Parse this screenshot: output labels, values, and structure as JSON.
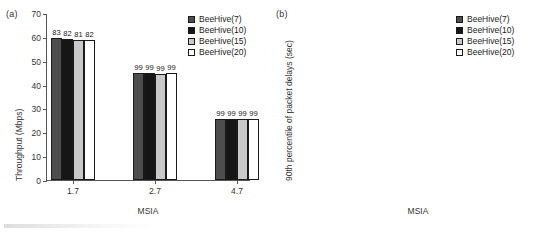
{
  "figure": {
    "width": 540,
    "height": 235,
    "background": "#ffffff"
  },
  "series_styles": [
    {
      "name": "BeeHive(7)",
      "color": "#4d4d4d"
    },
    {
      "name": "BeeHive(10)",
      "color": "#161616"
    },
    {
      "name": "BeeHive(15)",
      "color": "#c9c9c9"
    },
    {
      "name": "BeeHive(20)",
      "color": "#ffffff"
    }
  ],
  "panels": {
    "a": {
      "tag": "(a)",
      "legend": {
        "position": "top-right",
        "entries": [
          "BeeHive(7)",
          "BeeHive(10)",
          "BeeHive(15)",
          "BeeHive(20)"
        ]
      },
      "y_ticks": [
        "0",
        "10",
        "20",
        "30",
        "40",
        "50",
        "60",
        "70"
      ],
      "x_ticks": [
        "1.7",
        "2.7",
        "4.7"
      ],
      "xlabel": "MSIA",
      "ylabel": "Throughput (Mbps)"
    },
    "b": {
      "tag": "(b)",
      "legend": {
        "position": "top-right",
        "entries": [
          "BeeHive(7)",
          "BeeHive(10)",
          "BeeHive(15)",
          "BeeHive(20)"
        ]
      },
      "y_ticks": [
        "0",
        "1",
        "2",
        "3",
        "4",
        "5",
        "6",
        "7",
        "8"
      ],
      "x_ticks": [
        "1.7",
        "2.7",
        "4.7"
      ],
      "xlabel": "MSIA",
      "ylabel": "90th percentile of packet delays (sec)"
    }
  },
  "chart_data": [
    {
      "type": "bar",
      "panel": "(a)",
      "title": "",
      "xlabel": "MSIA",
      "ylabel": "Throughput (Mbps)",
      "categories": [
        "1.7",
        "2.7",
        "4.7"
      ],
      "ylim": [
        0,
        70
      ],
      "ytick_step": 10,
      "grid": false,
      "legend_position": "top-right",
      "series": [
        {
          "name": "BeeHive(7)",
          "color": "#4d4d4d",
          "values": [
            59.5,
            44.9,
            25.7
          ],
          "bar_labels": [
            "83",
            "99",
            "99"
          ]
        },
        {
          "name": "BeeHive(10)",
          "color": "#161616",
          "values": [
            59.3,
            44.9,
            25.6
          ],
          "bar_labels": [
            "82",
            "99",
            "99"
          ]
        },
        {
          "name": "BeeHive(15)",
          "color": "#c9c9c9",
          "values": [
            58.7,
            44.4,
            25.6
          ],
          "bar_labels": [
            "81",
            "99",
            "99"
          ]
        },
        {
          "name": "BeeHive(20)",
          "color": "#ffffff",
          "values": [
            58.8,
            45.0,
            25.6
          ],
          "bar_labels": [
            "82",
            "99",
            "99"
          ]
        }
      ]
    },
    {
      "type": "bar",
      "panel": "(b)",
      "title": "",
      "xlabel": "MSIA",
      "ylabel": "90th percentile of packet delays (sec)",
      "categories": [
        "1.7",
        "2.7",
        "4.7"
      ],
      "ylim": [
        0,
        8
      ],
      "ytick_step": 1,
      "grid": false,
      "legend_position": "top-right",
      "series": [
        {
          "name": "BeeHive(7)",
          "color": "#4d4d4d",
          "values": [
            2.65,
            0.4,
            0.09
          ],
          "bar_labels": [
            "83",
            "99",
            "99"
          ]
        },
        {
          "name": "BeeHive(10)",
          "color": "#161616",
          "values": [
            2.47,
            0.4,
            0.08
          ],
          "bar_labels": [
            "82",
            "99",
            "99"
          ]
        },
        {
          "name": "BeeHive(15)",
          "color": "#c9c9c9",
          "values": [
            2.45,
            0.36,
            0.08
          ],
          "bar_labels": [
            "81",
            "99",
            "99"
          ]
        },
        {
          "name": "BeeHive(20)",
          "color": "#ffffff",
          "values": [
            2.45,
            0.4,
            0.08
          ],
          "bar_labels": [
            "82",
            "99",
            "99"
          ]
        }
      ]
    }
  ]
}
